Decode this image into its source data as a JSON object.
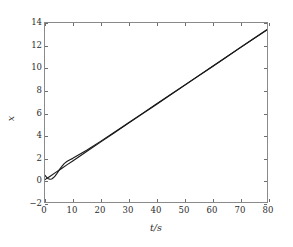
{
  "chart_data": {
    "type": "line",
    "title": "",
    "xlabel": "t/s",
    "ylabel": "x",
    "xlim": [
      0,
      80
    ],
    "ylim": [
      -2,
      14
    ],
    "xticks": [
      0,
      10,
      20,
      30,
      40,
      50,
      60,
      70,
      80
    ],
    "yticks": [
      -2,
      0,
      2,
      4,
      6,
      8,
      10,
      12,
      14
    ],
    "xtick_labels": [
      "0",
      "10",
      "20",
      "30",
      "40",
      "50",
      "60",
      "70",
      "80"
    ],
    "ytick_labels": [
      "−2",
      "0",
      "2",
      "4",
      "6",
      "8",
      "10",
      "12",
      "14"
    ],
    "grid": false,
    "legend": null,
    "line_color": "#1a1a1a",
    "frame_color": "#8a8a8a",
    "background": "#ffffff",
    "series": [
      {
        "name": "reference",
        "color": "#1a1a1a",
        "x": [
          0,
          2,
          4,
          6,
          8,
          10,
          15,
          20,
          25,
          30,
          35,
          40,
          45,
          50,
          55,
          60,
          65,
          70,
          75,
          80
        ],
        "y": [
          0.0,
          0.33,
          0.67,
          1.0,
          1.34,
          1.67,
          2.51,
          3.35,
          4.19,
          5.03,
          5.86,
          6.7,
          7.54,
          8.38,
          9.21,
          10.05,
          10.89,
          11.73,
          12.57,
          13.4
        ]
      },
      {
        "name": "response",
        "color": "#1a1a1a",
        "x": [
          0,
          0.6,
          1.2,
          1.8,
          2.4,
          3.0,
          3.6,
          4.2,
          4.8,
          5.4,
          6.0,
          7.0,
          8.0,
          9.0,
          10,
          15,
          20,
          25,
          30,
          35,
          40,
          45,
          50,
          55,
          60,
          65,
          70,
          75,
          80
        ],
        "y": [
          0.38,
          0.2,
          0.08,
          0.03,
          0.06,
          0.16,
          0.32,
          0.52,
          0.74,
          0.96,
          1.16,
          1.45,
          1.64,
          1.78,
          1.9,
          2.62,
          3.42,
          4.24,
          5.07,
          5.9,
          6.73,
          7.56,
          8.4,
          9.23,
          10.07,
          10.9,
          11.74,
          12.57,
          13.4
        ]
      }
    ]
  }
}
